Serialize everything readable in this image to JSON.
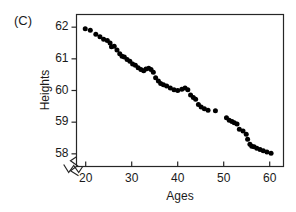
{
  "panel": {
    "label": "(C)"
  },
  "chart_data": {
    "type": "scatter",
    "title": "",
    "subtitle": "",
    "xlabel": "Ages",
    "ylabel": "Heights",
    "xlim": [
      18,
      63
    ],
    "ylim": [
      57.6,
      62.4
    ],
    "xticks": [
      20,
      30,
      40,
      50,
      60
    ],
    "yticks": [
      58,
      59,
      60,
      61,
      62
    ],
    "xtick_labels": [
      "20",
      "30",
      "40",
      "50",
      "60"
    ],
    "ytick_labels": [
      "58",
      "59",
      "60",
      "61",
      "62"
    ],
    "grid": false,
    "legend": null,
    "axis_break_x": true,
    "axis_break_y": true,
    "marker": {
      "shape": "circle",
      "color": "#000000",
      "size_px": 5
    },
    "annotations": [],
    "points": [
      [
        19.9,
        61.95
      ],
      [
        21.0,
        61.9
      ],
      [
        22.2,
        61.78
      ],
      [
        23.1,
        61.7
      ],
      [
        23.9,
        61.62
      ],
      [
        24.7,
        61.58
      ],
      [
        25.3,
        61.5
      ],
      [
        25.6,
        61.38
      ],
      [
        26.2,
        61.4
      ],
      [
        26.8,
        61.28
      ],
      [
        27.4,
        61.16
      ],
      [
        27.9,
        61.08
      ],
      [
        28.4,
        61.06
      ],
      [
        29.0,
        60.98
      ],
      [
        29.6,
        60.92
      ],
      [
        30.2,
        60.84
      ],
      [
        30.8,
        60.8
      ],
      [
        31.4,
        60.72
      ],
      [
        32.0,
        60.66
      ],
      [
        32.6,
        60.62
      ],
      [
        33.1,
        60.68
      ],
      [
        33.7,
        60.7
      ],
      [
        34.2,
        60.66
      ],
      [
        34.7,
        60.58
      ],
      [
        35.2,
        60.4
      ],
      [
        35.8,
        60.3
      ],
      [
        36.3,
        60.22
      ],
      [
        36.9,
        60.18
      ],
      [
        37.6,
        60.14
      ],
      [
        38.4,
        60.08
      ],
      [
        39.2,
        60.02
      ],
      [
        40.0,
        60.0
      ],
      [
        40.9,
        60.04
      ],
      [
        41.6,
        60.08
      ],
      [
        42.2,
        60.02
      ],
      [
        42.8,
        59.86
      ],
      [
        43.4,
        59.78
      ],
      [
        43.9,
        59.72
      ],
      [
        44.5,
        59.56
      ],
      [
        45.1,
        59.48
      ],
      [
        45.8,
        59.42
      ],
      [
        46.6,
        59.38
      ],
      [
        48.2,
        59.36
      ],
      [
        50.6,
        59.14
      ],
      [
        51.2,
        59.06
      ],
      [
        51.8,
        59.02
      ],
      [
        52.3,
        58.98
      ],
      [
        52.9,
        58.94
      ],
      [
        53.4,
        58.78
      ],
      [
        54.2,
        58.72
      ],
      [
        54.9,
        58.62
      ],
      [
        55.2,
        58.46
      ],
      [
        55.7,
        58.3
      ],
      [
        56.1,
        58.24
      ],
      [
        56.6,
        58.22
      ],
      [
        57.2,
        58.18
      ],
      [
        57.9,
        58.14
      ],
      [
        58.6,
        58.1
      ],
      [
        59.4,
        58.06
      ],
      [
        60.3,
        58.02
      ]
    ]
  }
}
